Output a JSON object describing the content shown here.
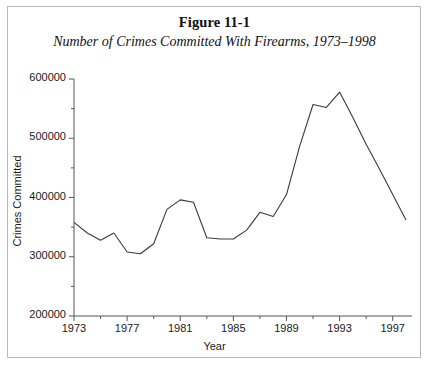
{
  "figure": {
    "title": "Figure 11-1",
    "subtitle": "Number of Crimes Committed With Firearms, 1973–1998"
  },
  "chart_data": {
    "type": "line",
    "title": "Number of Crimes Committed With Firearms, 1973–1998",
    "xlabel": "Year",
    "ylabel": "Crimes Committed",
    "xlim": [
      1973,
      1998
    ],
    "ylim": [
      200000,
      600000
    ],
    "ytick_values": [
      200000,
      300000,
      400000,
      500000,
      600000
    ],
    "ytick_labels": [
      "200000",
      "300000",
      "400000",
      "500000",
      "600000"
    ],
    "yminor_step": 50000,
    "xtick_values": [
      1973,
      1977,
      1981,
      1985,
      1989,
      1993,
      1997
    ],
    "xtick_labels": [
      "1973",
      "1977",
      "1981",
      "1985",
      "1989",
      "1993",
      "1997"
    ],
    "xminor_step": 2,
    "grid": false,
    "legend": "none",
    "line_color": "#3a3a3a",
    "x": [
      1973,
      1974,
      1975,
      1976,
      1977,
      1978,
      1979,
      1980,
      1981,
      1982,
      1983,
      1984,
      1985,
      1986,
      1987,
      1988,
      1989,
      1990,
      1991,
      1992,
      1993,
      1994,
      1995,
      1996,
      1997,
      1998
    ],
    "values": [
      358000,
      340000,
      328000,
      340000,
      308000,
      305000,
      322000,
      380000,
      396000,
      392000,
      332000,
      330000,
      330000,
      345000,
      375000,
      368000,
      405000,
      487000,
      557000,
      552000,
      578000,
      535000,
      490000,
      448000,
      405000,
      362000
    ],
    "series": [
      {
        "name": "Crimes Committed With Firearms",
        "values": [
          358000,
          340000,
          328000,
          340000,
          308000,
          305000,
          322000,
          380000,
          396000,
          392000,
          332000,
          330000,
          330000,
          345000,
          375000,
          368000,
          405000,
          487000,
          557000,
          552000,
          578000,
          535000,
          490000,
          448000,
          405000,
          362000
        ]
      }
    ]
  },
  "colors": {
    "line": "#3a3a3a",
    "axis": "#555555",
    "border": "#b9b9b9",
    "text": "#111111"
  }
}
